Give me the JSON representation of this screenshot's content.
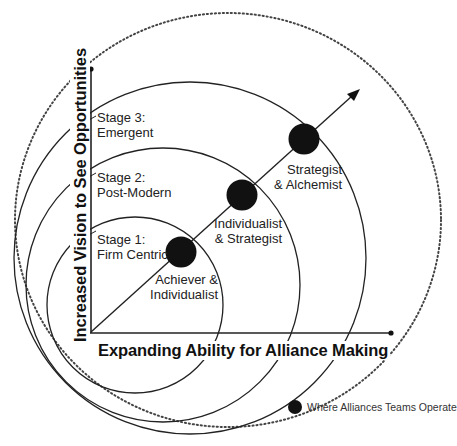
{
  "diagram": {
    "axes": {
      "x_label": "Expanding Ability for Alliance Making",
      "y_label": "Increased Vision to See Opportunities"
    },
    "stages": [
      {
        "id": "stage1",
        "title": "Stage 1:",
        "name": "Firm Centric",
        "role_line1": "Achiever &",
        "role_line2": "Individualist"
      },
      {
        "id": "stage2",
        "title": "Stage 2:",
        "name": "Post-Modern",
        "role_line1": "Individualist",
        "role_line2": "& Strategist"
      },
      {
        "id": "stage3",
        "title": "Stage 3:",
        "name": "Emergent",
        "role_line1": "Strategist",
        "role_line2": "& Alchemist"
      }
    ],
    "legend": {
      "marker": "filled-black-circle",
      "label": "Where Alliances Teams Operate"
    },
    "colors": {
      "line": "#222222",
      "dot": "#111111",
      "background": "#ffffff"
    }
  }
}
